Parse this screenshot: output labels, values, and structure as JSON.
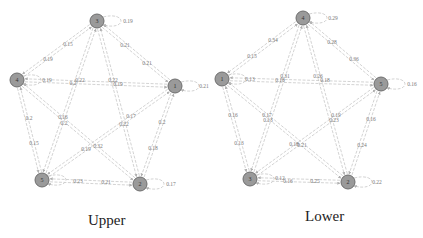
{
  "figures": [
    {
      "caption": "Upper",
      "nodes": [
        {
          "id": "3",
          "x": 97,
          "y": 21
        },
        {
          "id": "4",
          "x": 17,
          "y": 80
        },
        {
          "id": "1",
          "x": 175,
          "y": 86
        },
        {
          "id": "5",
          "x": 42,
          "y": 180
        },
        {
          "id": "2",
          "x": 140,
          "y": 184
        }
      ],
      "edge_labels": [
        {
          "text": "0.19",
          "x": 128,
          "y": 23
        },
        {
          "text": "0.15",
          "x": 68,
          "y": 46
        },
        {
          "text": "0.19",
          "x": 48,
          "y": 61
        },
        {
          "text": "0.21",
          "x": 125,
          "y": 47
        },
        {
          "text": "0.21",
          "x": 147,
          "y": 65
        },
        {
          "text": "0.19",
          "x": 47,
          "y": 82
        },
        {
          "text": "0.22",
          "x": 80,
          "y": 82
        },
        {
          "text": "0.2",
          "x": 73,
          "y": 85
        },
        {
          "text": "0.22",
          "x": 113,
          "y": 82
        },
        {
          "text": "0.19",
          "x": 118,
          "y": 86
        },
        {
          "text": "0.21",
          "x": 204,
          "y": 88
        },
        {
          "text": "0.2",
          "x": 29,
          "y": 120
        },
        {
          "text": "0.16",
          "x": 63,
          "y": 119
        },
        {
          "text": "0.2",
          "x": 64,
          "y": 125
        },
        {
          "text": "0.17",
          "x": 131,
          "y": 118
        },
        {
          "text": "0.22",
          "x": 124,
          "y": 126
        },
        {
          "text": "0.2",
          "x": 162,
          "y": 124
        },
        {
          "text": "0.15",
          "x": 34,
          "y": 145
        },
        {
          "text": "0.19",
          "x": 86,
          "y": 151
        },
        {
          "text": "0.32",
          "x": 98,
          "y": 148
        },
        {
          "text": "0.18",
          "x": 153,
          "y": 150
        },
        {
          "text": "0.23",
          "x": 78,
          "y": 183
        },
        {
          "text": "0.21",
          "x": 106,
          "y": 184
        },
        {
          "text": "0.17",
          "x": 171,
          "y": 186
        }
      ]
    },
    {
      "caption": "Lower",
      "nodes": [
        {
          "id": "4",
          "x": 303,
          "y": 18
        },
        {
          "id": "1",
          "x": 222,
          "y": 79
        },
        {
          "id": "5",
          "x": 381,
          "y": 84
        },
        {
          "id": "3",
          "x": 250,
          "y": 179
        },
        {
          "id": "2",
          "x": 348,
          "y": 182
        }
      ],
      "edge_labels": [
        {
          "text": "0.29",
          "x": 333,
          "y": 20
        },
        {
          "text": "0.34",
          "x": 273,
          "y": 42
        },
        {
          "text": "0.28",
          "x": 332,
          "y": 44
        },
        {
          "text": "0.15",
          "x": 252,
          "y": 58
        },
        {
          "text": "0.36",
          "x": 354,
          "y": 61
        },
        {
          "text": "0.13",
          "x": 250,
          "y": 81
        },
        {
          "text": "0.31",
          "x": 285,
          "y": 78
        },
        {
          "text": "0.18",
          "x": 280,
          "y": 82
        },
        {
          "text": "0.26",
          "x": 318,
          "y": 78
        },
        {
          "text": "0.18",
          "x": 325,
          "y": 82
        },
        {
          "text": "0.16",
          "x": 412,
          "y": 86
        },
        {
          "text": "0.16",
          "x": 233,
          "y": 117
        },
        {
          "text": "0.17",
          "x": 267,
          "y": 117
        },
        {
          "text": "0.13",
          "x": 268,
          "y": 122
        },
        {
          "text": "0.19",
          "x": 336,
          "y": 117
        },
        {
          "text": "0.23",
          "x": 334,
          "y": 122
        },
        {
          "text": "0.16",
          "x": 371,
          "y": 121
        },
        {
          "text": "0.13",
          "x": 239,
          "y": 145
        },
        {
          "text": "0.18",
          "x": 294,
          "y": 146
        },
        {
          "text": "0.21",
          "x": 302,
          "y": 147
        },
        {
          "text": "0.24",
          "x": 362,
          "y": 147
        },
        {
          "text": "0.12",
          "x": 280,
          "y": 180
        },
        {
          "text": "0.16",
          "x": 288,
          "y": 183
        },
        {
          "text": "0.25",
          "x": 315,
          "y": 183
        },
        {
          "text": "0.22",
          "x": 377,
          "y": 184
        }
      ]
    }
  ]
}
